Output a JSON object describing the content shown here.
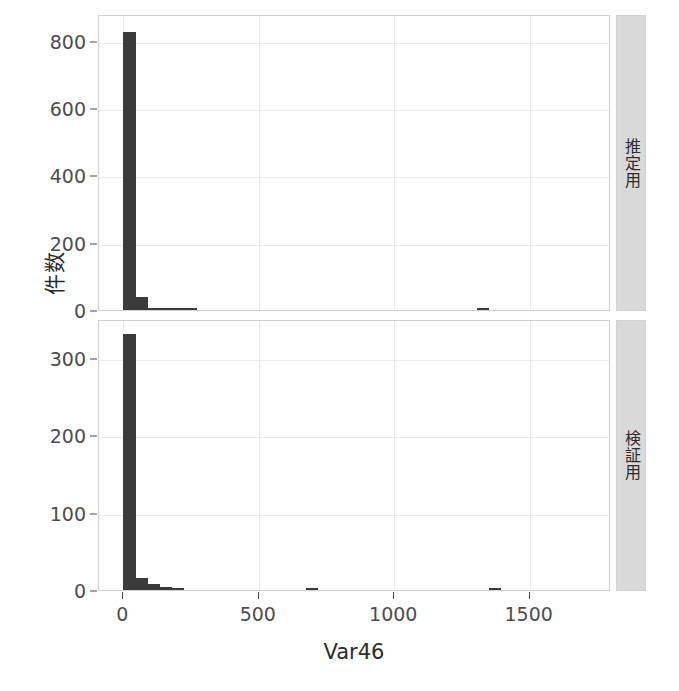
{
  "figure": {
    "xlabel": "Var46",
    "ylabel": "件数",
    "background": "#ffffff",
    "bar_color": "#3b3b3b",
    "grid_color": "#ebebeb",
    "strip_background": "#d9d9d9",
    "panel_border": "#d2d2d2"
  },
  "panels": [
    {
      "strip_label": "推定用"
    },
    {
      "strip_label": "検証用"
    }
  ],
  "axes": {
    "x": {
      "ticks": [
        0,
        500,
        1000,
        1500
      ],
      "tick_labels": [
        "0",
        "500",
        "1000",
        "1500"
      ],
      "range": [
        -90,
        1800
      ]
    },
    "y_top": {
      "ticks": [
        0,
        200,
        400,
        600,
        800
      ],
      "tick_labels": [
        "0",
        "200",
        "400",
        "600",
        "800"
      ],
      "range": [
        0,
        880
      ]
    },
    "y_bottom": {
      "ticks": [
        0,
        100,
        200,
        300
      ],
      "tick_labels": [
        "0",
        "100",
        "200",
        "300"
      ],
      "range": [
        0,
        350
      ]
    }
  },
  "chart_data": {
    "type": "bar",
    "title": "",
    "subtitle": "",
    "xlabel": "Var46",
    "ylabel": "件数",
    "grid": true,
    "legend": "none",
    "orientation": "vertical",
    "facet": {
      "variable": "データ区分",
      "position": "right-strip",
      "levels": [
        "推定用",
        "検証用"
      ]
    },
    "bin_width": 45,
    "xlim": [
      -90,
      1800
    ],
    "panels": [
      {
        "name": "推定用",
        "ylim": [
          0,
          880
        ],
        "yticks": [
          0,
          200,
          400,
          600,
          800
        ],
        "bins": [
          {
            "x_start": 0,
            "x_end": 45,
            "count": 826
          },
          {
            "x_start": 45,
            "x_end": 90,
            "count": 38
          },
          {
            "x_start": 90,
            "x_end": 135,
            "count": 6
          },
          {
            "x_start": 135,
            "x_end": 180,
            "count": 3
          },
          {
            "x_start": 180,
            "x_end": 225,
            "count": 2
          },
          {
            "x_start": 225,
            "x_end": 270,
            "count": 1
          },
          {
            "x_start": 1305,
            "x_end": 1350,
            "count": 1
          }
        ]
      },
      {
        "name": "検証用",
        "ylim": [
          0,
          350
        ],
        "yticks": [
          0,
          100,
          200,
          300
        ],
        "bins": [
          {
            "x_start": 0,
            "x_end": 45,
            "count": 331
          },
          {
            "x_start": 45,
            "x_end": 90,
            "count": 16
          },
          {
            "x_start": 90,
            "x_end": 135,
            "count": 8
          },
          {
            "x_start": 135,
            "x_end": 180,
            "count": 4
          },
          {
            "x_start": 180,
            "x_end": 225,
            "count": 2
          },
          {
            "x_start": 675,
            "x_end": 720,
            "count": 1
          },
          {
            "x_start": 1350,
            "x_end": 1395,
            "count": 1
          }
        ]
      }
    ]
  }
}
